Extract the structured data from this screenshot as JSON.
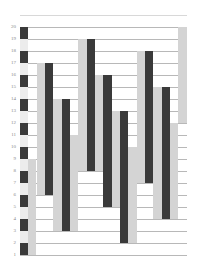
{
  "chart_data": {
    "type": "bar",
    "subtype": "floating-range",
    "title": "",
    "xlabel": "",
    "ylabel": "",
    "ylim": [
      1,
      20
    ],
    "y_ticks": [
      20,
      19,
      18,
      17,
      16,
      15,
      14,
      13,
      12,
      11,
      10,
      9,
      8,
      7,
      6,
      5,
      4,
      3,
      2,
      1
    ],
    "grid": true,
    "legend": null,
    "colors": {
      "dark": "#3a3a3a",
      "light": "#d4d4d4",
      "grid": "#b8b8b8",
      "background": "#ffffff"
    },
    "striped_column": {
      "x": 20,
      "width": 8,
      "segments": [
        {
          "from": 19,
          "to": 20,
          "shade": "dark"
        },
        {
          "from": 18,
          "to": 19,
          "shade": "light"
        },
        {
          "from": 17,
          "to": 18,
          "shade": "dark"
        },
        {
          "from": 16,
          "to": 17,
          "shade": "light"
        },
        {
          "from": 15,
          "to": 16,
          "shade": "dark"
        },
        {
          "from": 14,
          "to": 15,
          "shade": "light"
        },
        {
          "from": 13,
          "to": 14,
          "shade": "dark"
        },
        {
          "from": 12,
          "to": 13,
          "shade": "light"
        },
        {
          "from": 11,
          "to": 12,
          "shade": "dark"
        },
        {
          "from": 10,
          "to": 11,
          "shade": "light"
        },
        {
          "from": 9,
          "to": 10,
          "shade": "dark"
        },
        {
          "from": 8,
          "to": 9,
          "shade": "light"
        },
        {
          "from": 7,
          "to": 8,
          "shade": "dark"
        },
        {
          "from": 6,
          "to": 7,
          "shade": "light"
        },
        {
          "from": 5,
          "to": 6,
          "shade": "dark"
        },
        {
          "from": 4,
          "to": 5,
          "shade": "light"
        },
        {
          "from": 3,
          "to": 4,
          "shade": "dark"
        },
        {
          "from": 2,
          "to": 3,
          "shade": "light"
        },
        {
          "from": 1,
          "to": 2,
          "shade": "dark"
        }
      ]
    },
    "bars": [
      {
        "x": 28,
        "width": 8,
        "shade": "light",
        "low": 1,
        "high": 9
      },
      {
        "x": 37,
        "width": 8,
        "shade": "light",
        "low": 6,
        "high": 17
      },
      {
        "x": 45,
        "width": 8,
        "shade": "dark",
        "low": 6,
        "high": 17
      },
      {
        "x": 53,
        "width": 9,
        "shade": "light",
        "low": 3,
        "high": 14
      },
      {
        "x": 62,
        "width": 8,
        "shade": "dark",
        "low": 3,
        "high": 14
      },
      {
        "x": 70,
        "width": 8,
        "shade": "light",
        "low": 3,
        "high": 11
      },
      {
        "x": 78,
        "width": 9,
        "shade": "light",
        "low": 8,
        "high": 19
      },
      {
        "x": 87,
        "width": 8,
        "shade": "dark",
        "low": 8,
        "high": 19
      },
      {
        "x": 95,
        "width": 8,
        "shade": "light",
        "low": 8,
        "high": 16
      },
      {
        "x": 103,
        "width": 9,
        "shade": "dark",
        "low": 5,
        "high": 16
      },
      {
        "x": 112,
        "width": 8,
        "shade": "light",
        "low": 5,
        "high": 13
      },
      {
        "x": 120,
        "width": 8,
        "shade": "dark",
        "low": 2,
        "high": 13
      },
      {
        "x": 128,
        "width": 9,
        "shade": "light",
        "low": 2,
        "high": 10
      },
      {
        "x": 137,
        "width": 8,
        "shade": "light",
        "low": 7,
        "high": 18
      },
      {
        "x": 145,
        "width": 8,
        "shade": "dark",
        "low": 7,
        "high": 18
      },
      {
        "x": 153,
        "width": 9,
        "shade": "light",
        "low": 4,
        "high": 15
      },
      {
        "x": 162,
        "width": 8,
        "shade": "dark",
        "low": 4,
        "high": 15
      },
      {
        "x": 170,
        "width": 8,
        "shade": "light",
        "low": 4,
        "high": 12
      },
      {
        "x": 178,
        "width": 9,
        "shade": "light",
        "low": 12,
        "high": 20
      }
    ]
  },
  "layout": {
    "y_for_20": 27,
    "px_per_unit": 12,
    "grid_left": 20,
    "grid_right": 187
  }
}
